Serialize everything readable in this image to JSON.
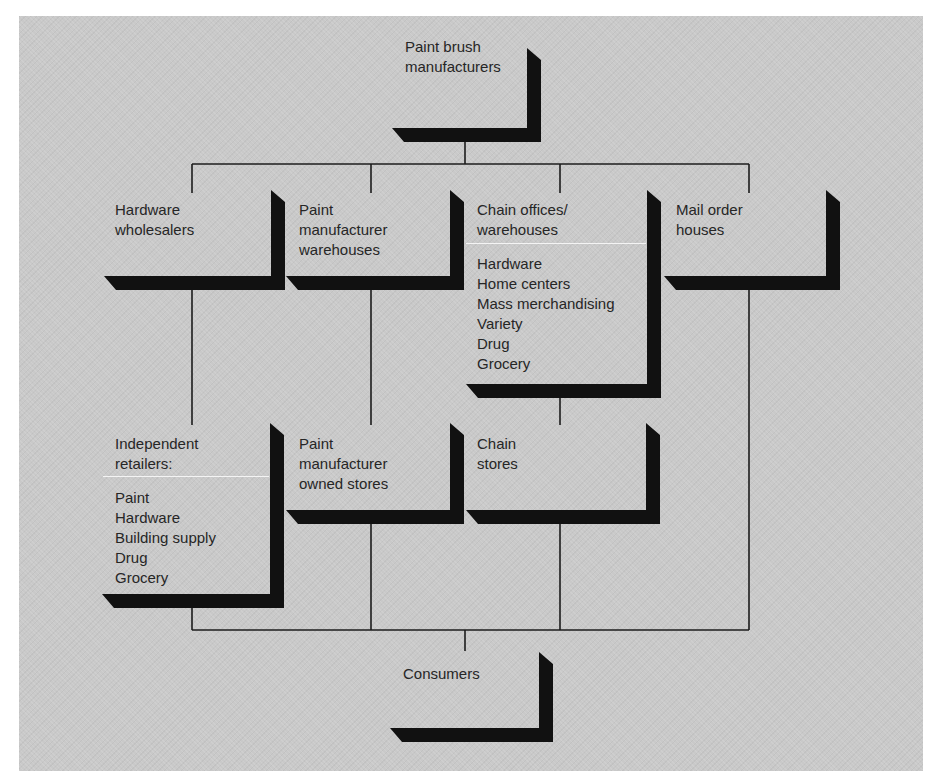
{
  "colors": {
    "background": "#c9c9c9",
    "shadow": "#111111",
    "connector": "#1c1c1c",
    "text": "#262626",
    "divider": "#f4f4f4"
  },
  "diagram": {
    "nodes": {
      "manufacturers": {
        "label": [
          "Paint brush",
          "manufacturers"
        ]
      },
      "hardware_wholesalers": {
        "label": [
          "Hardware",
          "wholesalers"
        ]
      },
      "paint_manufacturer_warehouses": {
        "label": [
          "Paint",
          "manufacturer",
          "warehouses"
        ]
      },
      "chain_offices": {
        "label": [
          "Chain offices/",
          "warehouses"
        ],
        "items": [
          "Hardware",
          "Home centers",
          "Mass merchandising",
          "Variety",
          "Drug",
          "Grocery"
        ]
      },
      "mail_order": {
        "label": [
          "Mail order",
          "houses"
        ]
      },
      "independent_retailers": {
        "label": [
          "Independent",
          "retailers:"
        ],
        "items": [
          "Paint",
          "Hardware",
          "Building supply",
          "Drug",
          "Grocery"
        ]
      },
      "paint_manufacturer_stores": {
        "label": [
          "Paint",
          "manufacturer",
          "owned stores"
        ]
      },
      "chain_stores": {
        "label": [
          "Chain",
          "stores"
        ]
      },
      "consumers": {
        "label": [
          "Consumers"
        ]
      }
    },
    "edges": [
      {
        "from": "manufacturers",
        "to": "hardware_wholesalers"
      },
      {
        "from": "manufacturers",
        "to": "paint_manufacturer_warehouses"
      },
      {
        "from": "manufacturers",
        "to": "chain_offices"
      },
      {
        "from": "manufacturers",
        "to": "mail_order"
      },
      {
        "from": "hardware_wholesalers",
        "to": "independent_retailers"
      },
      {
        "from": "paint_manufacturer_warehouses",
        "to": "paint_manufacturer_stores"
      },
      {
        "from": "chain_offices",
        "to": "chain_stores"
      },
      {
        "from": "independent_retailers",
        "to": "consumers"
      },
      {
        "from": "paint_manufacturer_stores",
        "to": "consumers"
      },
      {
        "from": "chain_stores",
        "to": "consumers"
      },
      {
        "from": "mail_order",
        "to": "consumers"
      }
    ]
  }
}
